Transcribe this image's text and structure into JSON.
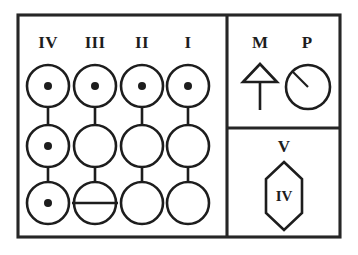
{
  "figure": {
    "type": "dental-quadrant-chart",
    "background_color": "#ffffff",
    "ink_color": "#1d1d1d"
  },
  "frame": {
    "outer": {
      "x": 18,
      "y": 15,
      "width": 322,
      "height": 222
    },
    "vertical_divider_x": 227,
    "horizontal_divider_y": 128
  },
  "left_panel": {
    "columns": [
      {
        "label": "IV",
        "center_x": 48,
        "positions": [
          {
            "row": 1,
            "center_y": 86,
            "marker": "dot"
          },
          {
            "row": 2,
            "center_y": 146,
            "marker": "dot"
          },
          {
            "row": 3,
            "center_y": 203,
            "marker": "dot"
          }
        ]
      },
      {
        "label": "III",
        "center_x": 95,
        "positions": [
          {
            "row": 1,
            "center_y": 86,
            "marker": "dot"
          },
          {
            "row": 2,
            "center_y": 146,
            "marker": "empty"
          },
          {
            "row": 3,
            "center_y": 203,
            "marker": "horizontal-line"
          }
        ]
      },
      {
        "label": "II",
        "center_x": 142,
        "positions": [
          {
            "row": 1,
            "center_y": 86,
            "marker": "dot"
          },
          {
            "row": 2,
            "center_y": 146,
            "marker": "empty"
          },
          {
            "row": 3,
            "center_y": 203,
            "marker": "empty"
          }
        ]
      },
      {
        "label": "I",
        "center_x": 188,
        "positions": [
          {
            "row": 1,
            "center_y": 86,
            "marker": "dot"
          },
          {
            "row": 2,
            "center_y": 146,
            "marker": "empty"
          },
          {
            "row": 3,
            "center_y": 203,
            "marker": "empty"
          }
        ]
      }
    ],
    "label_baseline_y": 48,
    "circle_radius": 21,
    "dot_radius": 4
  },
  "right_top_panel": {
    "items": [
      {
        "label": "M",
        "icon": "up-arrow-icon",
        "label_x": 260,
        "label_baseline_y": 48
      },
      {
        "label": "P",
        "icon": "gauge-icon",
        "label_x": 307,
        "label_baseline_y": 48
      }
    ],
    "arrow": {
      "center_x": 260,
      "apex_y": 64,
      "base_y": 82,
      "half_width": 17,
      "stem_bottom_y": 110
    },
    "gauge": {
      "center_x": 308,
      "center_y": 87,
      "radius": 22,
      "needle_angle_deg": 225
    }
  },
  "right_bottom_panel": {
    "label": "V",
    "label_x": 284,
    "label_baseline_y": 152,
    "hexagon": {
      "center_x": 284,
      "center_y": 196,
      "half_width": 18,
      "half_height": 34,
      "shoulder_offset": 17,
      "inner_label": "IV"
    }
  }
}
